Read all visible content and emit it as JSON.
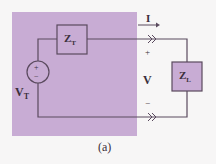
{
  "figure": {
    "caption": "(a)",
    "colors": {
      "thevenin_box": "#c8acd4",
      "wire": "#5a4a5e",
      "component_fill": "#c8acd4",
      "background": "#f7f6f6"
    },
    "components": {
      "source": {
        "label_main": "V",
        "label_sub": "T",
        "plus": "+",
        "minus": "−"
      },
      "thevenin_impedance": {
        "label_main": "Z",
        "label_sub": "T"
      },
      "load_impedance": {
        "label_main": "Z",
        "label_sub": "L"
      }
    },
    "annotations": {
      "current": "I",
      "voltage": "V",
      "plus": "+",
      "minus": "−"
    }
  }
}
